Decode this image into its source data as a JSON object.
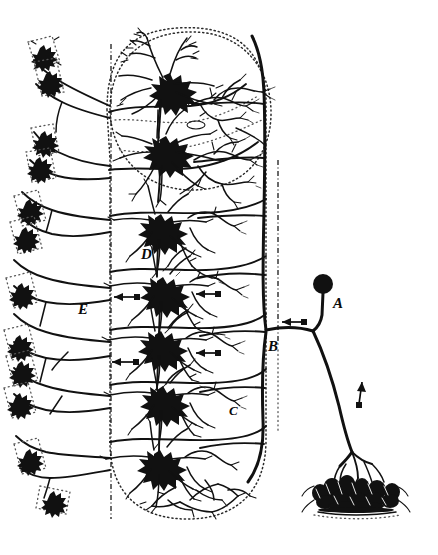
{
  "figure": {
    "background_color": "#ffffff",
    "ink_color": "#111111",
    "width": 438,
    "height": 555,
    "labels": [
      {
        "id": "A",
        "text": "A",
        "x": 333,
        "y": 308,
        "desc": "dorsal-root ganglion cell body"
      },
      {
        "id": "B",
        "text": "B",
        "x": 268,
        "y": 351,
        "desc": "bifurcation of dorsal root fibre"
      },
      {
        "id": "C",
        "text": "C",
        "x": 229,
        "y": 415,
        "desc": "descending collateral branch"
      },
      {
        "id": "D",
        "text": "D",
        "x": 141,
        "y": 259,
        "desc": "grey-matter neuron receiving collaterals"
      },
      {
        "id": "E",
        "text": "E",
        "x": 78,
        "y": 314,
        "desc": "motor axon leaving toward periphery"
      }
    ],
    "arrows": [
      {
        "id": "arrow-1",
        "x": 207,
        "y": 294,
        "dir": "left",
        "desc": "conduction direction, upper collateral"
      },
      {
        "id": "arrow-2",
        "x": 126,
        "y": 297,
        "dir": "left",
        "desc": "conduction direction toward E"
      },
      {
        "id": "arrow-3",
        "x": 292,
        "y": 322,
        "dir": "left",
        "desc": "conduction direction at B entry"
      },
      {
        "id": "arrow-4",
        "x": 207,
        "y": 353,
        "dir": "left",
        "desc": "conduction direction, mid collateral"
      },
      {
        "id": "arrow-5",
        "x": 124,
        "y": 362,
        "dir": "left",
        "desc": "conduction direction, mid-left"
      },
      {
        "id": "arrow-6",
        "x": 361,
        "y": 390,
        "dir": "up",
        "desc": "afferent conduction up peripheral nerve"
      }
    ],
    "structures": [
      {
        "id": "grey-matter-outline",
        "desc": "dotted outline of spinal grey matter (rounded capsule)"
      },
      {
        "id": "midline",
        "desc": "vertical dash-dot midline of cord"
      },
      {
        "id": "right-boundary",
        "desc": "vertical dash-dot lateral boundary"
      },
      {
        "id": "dorsal-horn-circle",
        "desc": "dotted circular region in upper grey matter"
      },
      {
        "id": "sensory-terminal",
        "desc": "peripheral sensory end-organ arborization, lower right"
      },
      {
        "id": "motor-endings",
        "desc": "peripheral motor terminal plaques along left margin"
      }
    ],
    "neurons": [
      {
        "id": "neuron-1",
        "x": 163,
        "y": 88,
        "size": "large",
        "region": "dorsal-horn"
      },
      {
        "id": "neuron-2",
        "x": 159,
        "y": 150,
        "size": "large",
        "region": "dorsal-horn"
      },
      {
        "id": "neuron-3",
        "x": 155,
        "y": 228,
        "size": "medium",
        "region": "intermediate"
      },
      {
        "id": "neuron-4",
        "x": 157,
        "y": 291,
        "size": "medium",
        "region": "intermediate"
      },
      {
        "id": "neuron-5",
        "x": 155,
        "y": 345,
        "size": "medium",
        "region": "ventral"
      },
      {
        "id": "neuron-6",
        "x": 157,
        "y": 400,
        "size": "medium",
        "region": "ventral"
      },
      {
        "id": "neuron-7",
        "x": 154,
        "y": 464,
        "size": "medium",
        "region": "ventral"
      }
    ],
    "ganglion_cell": {
      "id": "ganglion-A",
      "x": 323,
      "y": 284,
      "radius": 9
    }
  }
}
